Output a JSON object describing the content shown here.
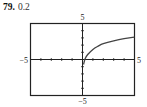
{
  "problem": {
    "number": "79.",
    "value": "0.2"
  },
  "chart_data": {
    "type": "line",
    "title": "",
    "xlabel": "",
    "ylabel": "",
    "xlim": [
      -5,
      5
    ],
    "ylim": [
      -5,
      5
    ],
    "grid": false,
    "tick_step": 1,
    "tick_labels": {
      "x_min": "−5",
      "x_max": "5",
      "y_min": "−5",
      "y_max": "5"
    },
    "series": [
      {
        "name": "curve",
        "x": [
          0.1,
          0.25,
          0.5,
          1,
          1.5,
          2,
          3,
          4,
          5
        ],
        "y": [
          -0.7,
          0.1,
          0.7,
          1.4,
          1.85,
          2.2,
          2.6,
          2.9,
          3.1
        ]
      }
    ],
    "note": "values estimated from pixel positions; curve rises steeply near x = 0 and flattens to the right"
  }
}
